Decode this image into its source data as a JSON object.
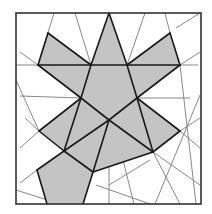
{
  "diagram": {
    "width": 212,
    "height": 214,
    "colors": {
      "background": "#ffffff",
      "fill": "#c4c4c4",
      "edge": "#1a1a1a",
      "thin_line": "#7a7a7a",
      "frame": "#333333"
    },
    "frame": {
      "x": 16,
      "y": 13,
      "w": 185,
      "h": 191
    },
    "shaded_polygons": [
      {
        "name": "left-wing",
        "points": "48,33 91,65 38,65"
      },
      {
        "name": "top-left-spike",
        "points": "109,13 91,65 81,98"
      },
      {
        "name": "top-spike",
        "points": "109,13 91,65 127,65"
      },
      {
        "name": "top-right-spike",
        "points": "109,13 127,65 137,98"
      },
      {
        "name": "right-wing",
        "points": "170,33 180,65 127,65"
      },
      {
        "name": "left-upper-body",
        "points": "38,65 91,65 81,98"
      },
      {
        "name": "right-upper-body",
        "points": "127,65 180,65 137,98"
      },
      {
        "name": "center-body",
        "points": "91,65 127,65 137,98 109,120 81,98"
      },
      {
        "name": "left-arm",
        "points": "81,98 109,120 64,151 39,131"
      },
      {
        "name": "right-arm",
        "points": "137,98 180,131 153,152 109,120"
      },
      {
        "name": "lower-center",
        "points": "109,120 153,152 93,172 64,151"
      },
      {
        "name": "bottom-pentagon",
        "points": "64,151 93,172 83,204 47,204 37,170"
      }
    ],
    "thick_edges": [
      [
        48,
        33,
        91,
        65
      ],
      [
        38,
        65,
        48,
        33
      ],
      [
        38,
        65,
        91,
        65
      ],
      [
        91,
        65,
        127,
        65
      ],
      [
        127,
        65,
        180,
        65
      ],
      [
        170,
        33,
        127,
        65
      ],
      [
        170,
        33,
        180,
        65
      ],
      [
        109,
        13,
        91,
        65
      ],
      [
        109,
        13,
        127,
        65
      ],
      [
        91,
        65,
        81,
        98
      ],
      [
        127,
        65,
        137,
        98
      ],
      [
        38,
        65,
        81,
        98
      ],
      [
        180,
        65,
        137,
        98
      ],
      [
        81,
        98,
        109,
        120
      ],
      [
        137,
        98,
        109,
        120
      ],
      [
        81,
        98,
        39,
        131
      ],
      [
        39,
        131,
        64,
        151
      ],
      [
        64,
        151,
        109,
        120
      ],
      [
        109,
        120,
        153,
        152
      ],
      [
        137,
        98,
        180,
        131
      ],
      [
        180,
        131,
        153,
        152
      ],
      [
        153,
        152,
        93,
        172
      ],
      [
        93,
        172,
        64,
        151
      ],
      [
        137,
        98,
        153,
        152
      ],
      [
        81,
        98,
        64,
        151
      ],
      [
        64,
        151,
        37,
        170
      ],
      [
        37,
        170,
        47,
        204
      ],
      [
        93,
        172,
        83,
        204
      ],
      [
        109,
        120,
        93,
        172
      ]
    ],
    "thin_lines": [
      [
        54,
        13,
        38,
        65
      ],
      [
        75,
        13,
        91,
        65
      ],
      [
        145,
        13,
        127,
        65
      ],
      [
        165,
        13,
        170,
        33
      ],
      [
        176,
        28,
        200,
        13
      ],
      [
        180,
        65,
        200,
        52
      ],
      [
        180,
        65,
        198,
        65
      ],
      [
        20,
        52,
        38,
        65
      ],
      [
        16,
        65,
        38,
        65
      ],
      [
        20,
        96,
        81,
        98
      ],
      [
        16,
        80,
        39,
        131
      ],
      [
        25,
        118,
        39,
        131
      ],
      [
        20,
        148,
        39,
        131
      ],
      [
        20,
        183,
        37,
        170
      ],
      [
        137,
        98,
        190,
        98
      ],
      [
        180,
        131,
        200,
        118
      ],
      [
        180,
        131,
        200,
        148
      ],
      [
        200,
        95,
        155,
        204
      ],
      [
        180,
        65,
        196,
        204
      ],
      [
        153,
        152,
        180,
        204
      ],
      [
        153,
        152,
        200,
        185
      ],
      [
        109,
        130,
        109,
        204
      ],
      [
        115,
        128,
        134,
        204
      ],
      [
        96,
        185,
        150,
        204
      ],
      [
        109,
        185,
        150,
        160
      ],
      [
        16,
        190,
        60,
        204
      ]
    ]
  }
}
